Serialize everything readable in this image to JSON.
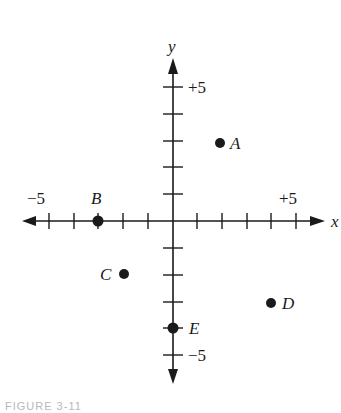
{
  "diagram": {
    "type": "coordinate-plane",
    "axes": {
      "x_label": "x",
      "y_label": "y",
      "x_range": [
        -5,
        5
      ],
      "y_range": [
        -5,
        5
      ],
      "tick_step": 1,
      "x_tick_labels": {
        "neg": "−5",
        "pos": "+5"
      },
      "y_tick_labels": {
        "pos": "+5",
        "neg": "−5"
      }
    },
    "points": [
      {
        "label": "A",
        "x": 2,
        "y": 3
      },
      {
        "label": "B",
        "x": -3,
        "y": 0
      },
      {
        "label": "C",
        "x": -2,
        "y": -2
      },
      {
        "label": "D",
        "x": 4,
        "y": -3
      },
      {
        "label": "E",
        "x": 0,
        "y": -4
      }
    ],
    "caption": "FIGURE 3-11"
  },
  "colors": {
    "ink": "#1a1a1a",
    "background": "#ffffff",
    "caption": "#b8b8b8"
  }
}
